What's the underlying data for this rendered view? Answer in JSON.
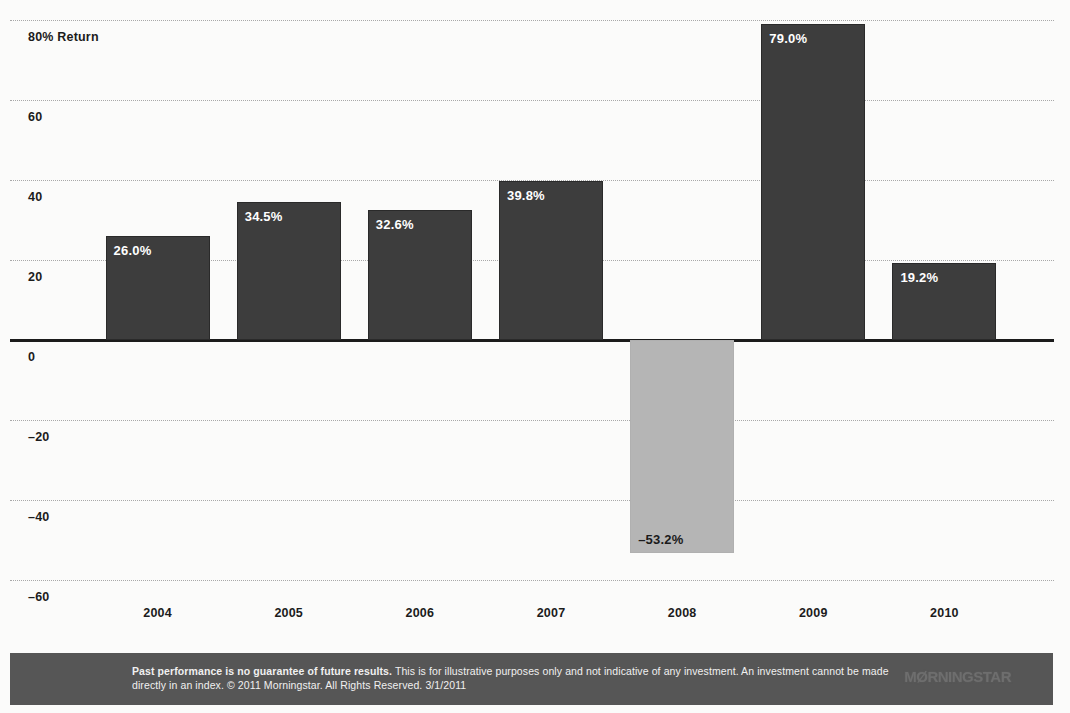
{
  "chart_data": {
    "type": "bar",
    "title": "",
    "xlabel": "",
    "ylabel": "80% Return",
    "categories": [
      "2004",
      "2005",
      "2006",
      "2007",
      "2008",
      "2009",
      "2010"
    ],
    "values": [
      26.0,
      34.5,
      32.6,
      39.8,
      -53.2,
      79.0,
      19.2
    ],
    "value_labels": [
      "26.0%",
      "34.5%",
      "32.6%",
      "39.8%",
      "–53.2%",
      "79.0%",
      "19.2%"
    ],
    "ylim": [
      -60,
      80
    ],
    "ytick_values": [
      80,
      60,
      40,
      20,
      0,
      -20,
      -40,
      -60
    ],
    "ytick_labels": [
      "80% Return",
      "60",
      "40",
      "20",
      "0",
      "–20",
      "–40",
      "–60"
    ],
    "grid": true,
    "legend": "none",
    "series_name": "Annual return",
    "colors": {
      "positive_bar": "#3d3d3d",
      "negative_bar": "#b5b5b5",
      "axis": "#1b1b1b",
      "gridline": "#9a9a9a",
      "background": "#fbfbfa",
      "footer_background": "#565656",
      "footer_text": "#f0f0f0"
    }
  },
  "footer": {
    "disclaimer_lead": "Past performance is no guarantee of future results.",
    "disclaimer_rest": " This is for illustrative purposes only and not indicative of any investment. An investment cannot be made directly in an index. © 2011 Morningstar. All Rights Reserved. 3/1/2011",
    "brand": "MØRNINGSTAR"
  }
}
